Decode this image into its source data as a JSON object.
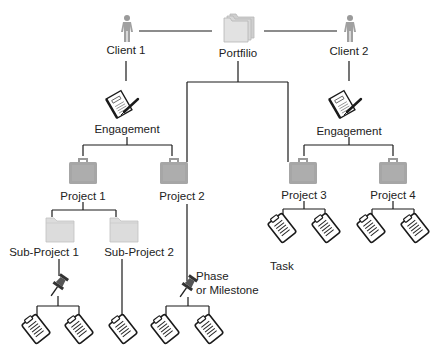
{
  "diagram": {
    "type": "hierarchy",
    "colors": {
      "line": "#1a1a1a",
      "icon_gray": "#a8a8a8",
      "folder_light": "#d9d9d9",
      "background": "#ffffff"
    },
    "portfolio": {
      "label": "Portfilio",
      "icon": "stacked-folders-icon"
    },
    "clients": [
      {
        "label": "Client 1",
        "icon": "person-icon"
      },
      {
        "label": "Client 2",
        "icon": "person-icon"
      }
    ],
    "engagements": [
      {
        "label": "Engagement",
        "icon": "contract-pen-icon",
        "client": "Client 1"
      },
      {
        "label": "Engagement",
        "icon": "contract-pen-icon",
        "client": "Client 2"
      }
    ],
    "projects": [
      {
        "label": "Project 1",
        "icon": "briefcase-icon"
      },
      {
        "label": "Project 2",
        "icon": "briefcase-icon"
      },
      {
        "label": "Project 3",
        "icon": "briefcase-icon"
      },
      {
        "label": "Project 4",
        "icon": "briefcase-icon"
      }
    ],
    "sub_projects": [
      {
        "label": "Sub-Project 1",
        "icon": "folder-icon",
        "parent": "Project 1"
      },
      {
        "label": "Sub-Project 2",
        "icon": "folder-icon",
        "parent": "Project 1"
      }
    ],
    "phase": {
      "label_line1": "Phase",
      "label_line2": "or Milestone",
      "icon": "pushpin-icon"
    },
    "task": {
      "label": "Task",
      "icon": "clipboard-icon"
    }
  }
}
